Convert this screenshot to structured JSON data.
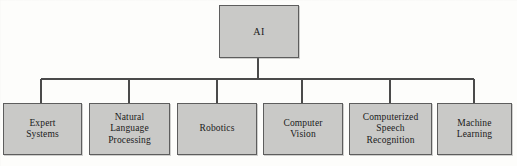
{
  "diagram": {
    "type": "hierarchy-tree",
    "title": "AI",
    "orientation": "top-down",
    "levels": 2,
    "colors": {
      "node_fill": "#c9c9c7",
      "node_border": "#5d5d5d",
      "connector": "#4a4a4a",
      "background": "#fdfdfb",
      "text": "#1a1a1a"
    },
    "root": {
      "id": "ai",
      "label": "AI"
    },
    "children": [
      {
        "id": "expert-systems",
        "label": "Expert\nSystems"
      },
      {
        "id": "natural-language-processing",
        "label": "Natural\nLanguage\nProcessing"
      },
      {
        "id": "robotics",
        "label": "Robotics"
      },
      {
        "id": "computer-vision",
        "label": "Computer\nVision"
      },
      {
        "id": "computerized-speech-recognition",
        "label": "Computerized\nSpeech\nRecognition"
      },
      {
        "id": "machine-learning",
        "label": "Machine\nLearning"
      }
    ]
  },
  "geometry": {
    "canvas": {
      "width": 517,
      "height": 166
    },
    "root_box": {
      "x": 219,
      "y": 5,
      "w": 80,
      "h": 53
    },
    "bus": {
      "x1": 41,
      "x2": 474,
      "y": 79
    },
    "stem": {
      "x": 258,
      "y1": 58,
      "y2": 79
    },
    "leaf_top": 103,
    "leaf_height": 52,
    "leaf_boxes": [
      {
        "x": 3,
        "w": 79,
        "drop_x": 41
      },
      {
        "x": 89,
        "w": 81,
        "drop_x": 129
      },
      {
        "x": 177,
        "w": 80,
        "drop_x": 217
      },
      {
        "x": 263,
        "w": 80,
        "drop_x": 302
      },
      {
        "x": 349,
        "w": 83,
        "drop_x": 390
      },
      {
        "x": 437,
        "w": 75,
        "drop_x": 474
      }
    ]
  }
}
